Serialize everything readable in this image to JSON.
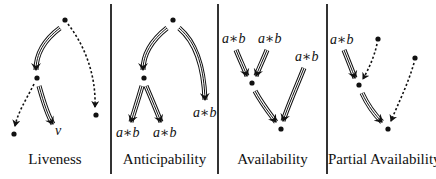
{
  "figure": {
    "panels": [
      {
        "title": "Liveness",
        "node_label": "v"
      },
      {
        "title": "Anticipability",
        "labels": [
          "a∗b",
          "a∗b",
          "a∗b"
        ]
      },
      {
        "title": "Availability",
        "labels": [
          "a∗b",
          "a∗b",
          "a∗b"
        ]
      },
      {
        "title": "Partial Availability",
        "labels": [
          "a∗b"
        ]
      }
    ],
    "legend_hint": {
      "solid_triple_arrow": "all paths",
      "dotted_arrow": "some path"
    },
    "colors": {
      "ink": "#111111",
      "background": "#ffffff",
      "divider": "#333333"
    }
  }
}
